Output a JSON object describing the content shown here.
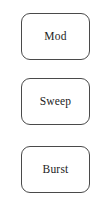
{
  "panel": {
    "name": "mode-button-panel",
    "background_color": "#ffffff",
    "border_color": "#4a4a4a",
    "text_color": "#1c1c1c"
  },
  "buttons": [
    {
      "label": "Mod"
    },
    {
      "label": "Sweep"
    },
    {
      "label": "Burst"
    }
  ]
}
